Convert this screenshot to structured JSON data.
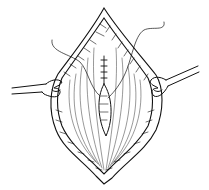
{
  "illustration": {
    "subject": "Surgical wound held open by two retractors with sutured incision in center",
    "colors": {
      "line": "#111111",
      "background": "#ffffff"
    }
  }
}
